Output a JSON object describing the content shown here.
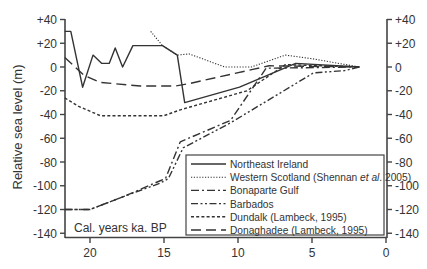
{
  "chart_data": {
    "type": "line",
    "title": "",
    "xlabel": "Cal. years ka. BP",
    "ylabel": "Relative sea level (m)",
    "xlim": [
      21.7,
      0
    ],
    "ylim": [
      -140,
      40
    ],
    "x_ticks": [
      "20",
      "15",
      "10",
      "5",
      "0"
    ],
    "x_tick_values": [
      20,
      15,
      10,
      5,
      0
    ],
    "y_ticks_left": [
      "+40",
      "+20",
      "0",
      "-20",
      "-40",
      "-60",
      "-80",
      "-100",
      "-120",
      "-140"
    ],
    "y_ticks_right": [
      "+40",
      "+20",
      "0",
      "-20",
      "-40",
      "-60",
      "-80",
      "-100",
      "-120",
      "-140"
    ],
    "y_tick_values": [
      40,
      20,
      0,
      -20,
      -40,
      -60,
      -80,
      -100,
      -120,
      -140
    ],
    "grid": false,
    "legend_position": "lower right",
    "series": [
      {
        "name": "Northeast Ireland",
        "style": "solid",
        "x": [
          21.7,
          21.3,
          20.5,
          19.8,
          19.2,
          18.7,
          18.3,
          17.8,
          17.1,
          15.9,
          15.1,
          14.1,
          13.6,
          9.9,
          6.1,
          1.8
        ],
        "y": [
          30,
          30,
          -17,
          10,
          3,
          3,
          16,
          0,
          18,
          18,
          18,
          10,
          -30,
          -17,
          3,
          0
        ]
      },
      {
        "name": "Western Scotland (Shennan et al. 2005)",
        "style": "dotted",
        "x": [
          15.9,
          15.1,
          14.1,
          13.3,
          10.9,
          9.1,
          6.8,
          5.0,
          1.8
        ],
        "y": [
          30,
          18,
          10,
          11,
          0,
          0,
          10,
          7,
          0
        ]
      },
      {
        "name": "Bonaparte Gulf",
        "style": "dash-dot",
        "x": [
          21.7,
          20.0,
          17.7,
          15.3,
          14.9,
          13.9,
          10.5,
          8.1,
          1.8
        ],
        "y": [
          -120,
          -120,
          -109,
          -96,
          -94,
          -63,
          -45,
          -1,
          0
        ]
      },
      {
        "name": "Barbados",
        "style": "dash-dot-dot",
        "x": [
          21.7,
          20.0,
          17.7,
          15.3,
          14.7,
          13.7,
          10.5,
          4.9,
          2.8,
          1.8
        ],
        "y": [
          -120,
          -120,
          -109,
          -98,
          -94,
          -68,
          -47,
          -5,
          -3,
          0
        ]
      },
      {
        "name": "Dundalk (Lambeck, 1995)",
        "style": "short-dash",
        "x": [
          21.7,
          20.8,
          19.3,
          16.7,
          15.0,
          13.9,
          9.4,
          6.8,
          1.8
        ],
        "y": [
          -26,
          -33,
          -41,
          -41,
          -41,
          -36,
          -20,
          2,
          0
        ]
      },
      {
        "name": "Donaghadee (Lambeck, 1995)",
        "style": "long-dash",
        "x": [
          21.7,
          20.4,
          19.3,
          16.6,
          14.2,
          13.3,
          9.0,
          7.9,
          1.8
        ],
        "y": [
          8,
          -7,
          -13,
          -16,
          -16,
          -14,
          -2,
          1,
          0
        ]
      }
    ]
  },
  "legend": {
    "items": [
      {
        "label": "Northeast Ireland",
        "style": "solid"
      },
      {
        "label": "Western Scotland (Shennan ",
        "italic": "et al",
        "suffix": ". 2005)",
        "style": "dotted"
      },
      {
        "label": "Bonaparte Gulf",
        "style": "dash-dot"
      },
      {
        "label": "Barbados",
        "style": "dash-dot-dot"
      },
      {
        "label": "Dundalk (Lambeck, 1995)",
        "style": "short-dash"
      },
      {
        "label": "Donaghadee (Lambeck, 1995)",
        "style": "long-dash"
      }
    ]
  },
  "colors": {
    "line": "#333333",
    "axis": "#444444",
    "background": "#ffffff"
  }
}
